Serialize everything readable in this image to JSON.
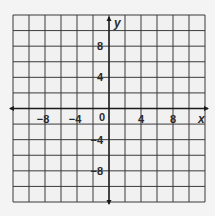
{
  "chart_data": {
    "type": "scatter",
    "title": "",
    "xlabel": "x",
    "ylabel": "y",
    "xlim": [
      -12,
      12
    ],
    "ylim": [
      -12,
      12
    ],
    "grid": true,
    "grid_step": 2,
    "x_ticks": [
      -8,
      -4,
      0,
      4,
      8
    ],
    "y_ticks": [
      8,
      4,
      -4,
      -8
    ],
    "x_tick_labels": [
      "−8",
      "−4",
      "0",
      "4",
      "8"
    ],
    "y_tick_labels": [
      "8",
      "4",
      "−4",
      "−8"
    ],
    "origin_label": "0",
    "axis_arrows": "both-ends",
    "series": [],
    "legend": null
  },
  "colors": {
    "grid": "#3a3a3a",
    "axis": "#1a1a1a",
    "background": "#f1f1f1",
    "text": "#2a2a2a"
  }
}
